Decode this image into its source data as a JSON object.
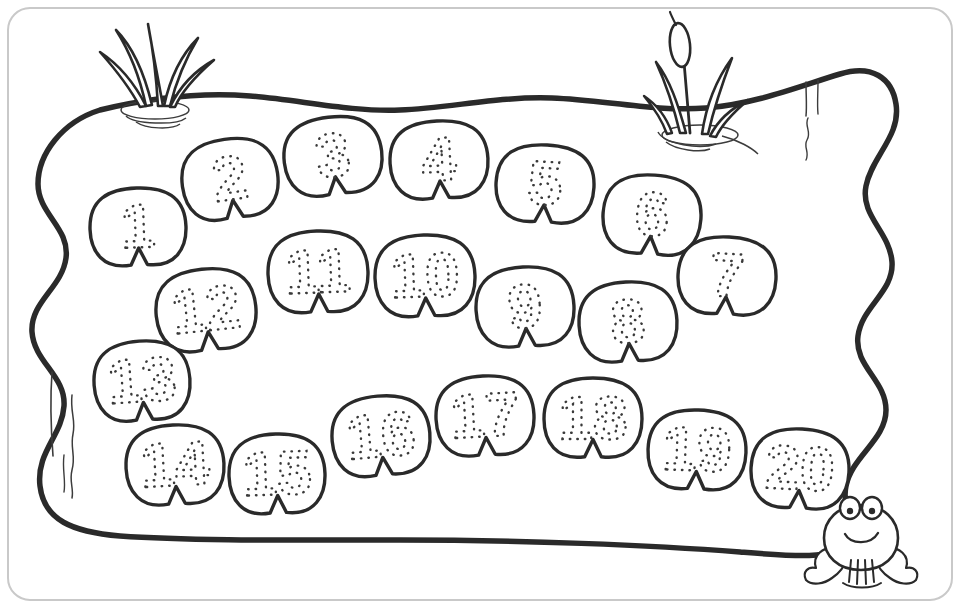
{
  "page": {
    "background_color": "#ffffff",
    "ink_color": "#2a2a2a",
    "dotted_number_color": "#3a3a3a",
    "frame_color": "#cccccc",
    "width": 960,
    "height": 608
  },
  "scene": {
    "pond_label": "pond",
    "frame_label": "page-border",
    "water_line_label": "water-detail-line"
  },
  "decorations": [
    {
      "name": "reed-cluster-left",
      "type": "grass-reeds",
      "blades": 5,
      "has_ripples": true
    },
    {
      "name": "cattail-cluster-right",
      "type": "cattail-reeds",
      "blades": 4,
      "has_cattail_head": true,
      "has_ripples": true
    }
  ],
  "frog": {
    "name": "frog",
    "expression": "smiling",
    "eyes": 2
  },
  "lilypads": [
    {
      "number": "1",
      "cx": 138,
      "cy": 228,
      "rx": 48,
      "ry": 40,
      "rot": -2
    },
    {
      "number": "2",
      "cx": 230,
      "cy": 180,
      "rx": 48,
      "ry": 41,
      "rot": -8
    },
    {
      "number": "3",
      "cx": 333,
      "cy": 157,
      "rx": 49,
      "ry": 40,
      "rot": -7
    },
    {
      "number": "4",
      "cx": 439,
      "cy": 161,
      "rx": 49,
      "ry": 40,
      "rot": -3
    },
    {
      "number": "5",
      "cx": 545,
      "cy": 185,
      "rx": 49,
      "ry": 40,
      "rot": 3
    },
    {
      "number": "6",
      "cx": 652,
      "cy": 216,
      "rx": 49,
      "ry": 41,
      "rot": 4
    },
    {
      "number": "7",
      "cx": 727,
      "cy": 277,
      "rx": 49,
      "ry": 40,
      "rot": 3
    },
    {
      "number": "8",
      "cx": 628,
      "cy": 323,
      "rx": 49,
      "ry": 41,
      "rot": -3
    },
    {
      "number": "9",
      "cx": 525,
      "cy": 308,
      "rx": 49,
      "ry": 41,
      "rot": -3
    },
    {
      "number": "10",
      "cx": 425,
      "cy": 277,
      "rx": 50,
      "ry": 42,
      "rot": -2
    },
    {
      "number": "11",
      "cx": 318,
      "cy": 273,
      "rx": 50,
      "ry": 42,
      "rot": -2
    },
    {
      "number": "12",
      "cx": 206,
      "cy": 311,
      "rx": 50,
      "ry": 42,
      "rot": -6
    },
    {
      "number": "13",
      "cx": 142,
      "cy": 382,
      "rx": 48,
      "ry": 41,
      "rot": -4
    },
    {
      "number": "14",
      "cx": 175,
      "cy": 466,
      "rx": 49,
      "ry": 41,
      "rot": -3
    },
    {
      "number": "15",
      "cx": 277,
      "cy": 475,
      "rx": 48,
      "ry": 41,
      "rot": -2
    },
    {
      "number": "16",
      "cx": 381,
      "cy": 437,
      "rx": 49,
      "ry": 41,
      "rot": -5
    },
    {
      "number": "17",
      "cx": 485,
      "cy": 417,
      "rx": 49,
      "ry": 41,
      "rot": -3
    },
    {
      "number": "18",
      "cx": 593,
      "cy": 419,
      "rx": 49,
      "ry": 41,
      "rot": 0
    },
    {
      "number": "19",
      "cx": 697,
      "cy": 451,
      "rx": 49,
      "ry": 41,
      "rot": 2
    },
    {
      "number": "20",
      "cx": 800,
      "cy": 470,
      "rx": 49,
      "ry": 41,
      "rot": 3
    }
  ]
}
